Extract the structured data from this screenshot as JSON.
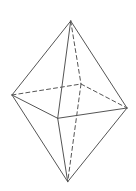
{
  "figure": {
    "type": "octahedron",
    "width": 136,
    "height": 191,
    "stroke_color": "#555555",
    "vertices": {
      "top": [
        70.7,
        21
      ],
      "left": [
        12,
        95
      ],
      "right": [
        127,
        108
      ],
      "front": [
        57.7,
        118.3
      ],
      "back": [
        81,
        84
      ],
      "bottom": [
        67.7,
        181.7
      ]
    },
    "visible_edges": [
      [
        "top",
        "left"
      ],
      [
        "top",
        "front"
      ],
      [
        "top",
        "right"
      ],
      [
        "left",
        "front"
      ],
      [
        "front",
        "right"
      ],
      [
        "left",
        "bottom"
      ],
      [
        "front",
        "bottom"
      ],
      [
        "right",
        "bottom"
      ]
    ],
    "hidden_edges": [
      [
        "top",
        "back"
      ],
      [
        "left",
        "back"
      ],
      [
        "back",
        "right"
      ],
      [
        "back",
        "bottom"
      ]
    ]
  }
}
